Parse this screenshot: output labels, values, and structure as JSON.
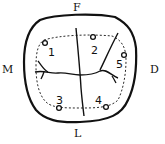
{
  "diagram": {
    "type": "tooth-occlusal-surface",
    "orientation_labels": {
      "top": "F",
      "bottom": "L",
      "left": "M",
      "right": "D"
    },
    "points": [
      {
        "id": "1",
        "label": "1"
      },
      {
        "id": "2",
        "label": "2"
      },
      {
        "id": "3",
        "label": "3"
      },
      {
        "id": "4",
        "label": "4"
      },
      {
        "id": "5",
        "label": "5"
      }
    ],
    "colors": {
      "stroke": "#111111",
      "background": "#ffffff"
    }
  }
}
